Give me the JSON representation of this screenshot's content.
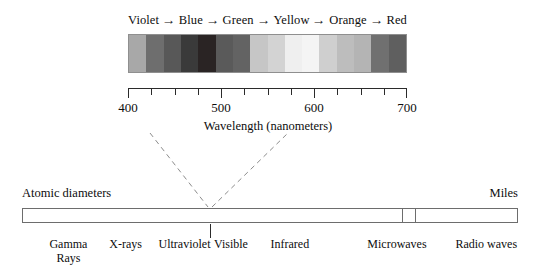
{
  "visible_spectrum": {
    "color_names": [
      "Violet",
      "Blue",
      "Green",
      "Yellow",
      "Orange",
      "Red"
    ],
    "arrow_glyph": "→",
    "bands": [
      {
        "name": "violet-far",
        "color": "#a8a8a8"
      },
      {
        "name": "violet",
        "color": "#6e6e6e"
      },
      {
        "name": "violet-blue",
        "color": "#585858"
      },
      {
        "name": "blue",
        "color": "#3a3a3a"
      },
      {
        "name": "blue-deep",
        "color": "#2a2424"
      },
      {
        "name": "blue-green",
        "color": "#5a5a5a"
      },
      {
        "name": "green",
        "color": "#636363"
      },
      {
        "name": "green-light",
        "color": "#c6c6c6"
      },
      {
        "name": "yellow-green",
        "color": "#d3d3d3"
      },
      {
        "name": "yellow",
        "color": "#efefef"
      },
      {
        "name": "yellow-pale",
        "color": "#f4f4f4"
      },
      {
        "name": "orange-light",
        "color": "#cfcfcf"
      },
      {
        "name": "orange",
        "color": "#bdbdbd"
      },
      {
        "name": "orange-red",
        "color": "#b4b4b4"
      },
      {
        "name": "red",
        "color": "#707070"
      },
      {
        "name": "red-deep",
        "color": "#5f5f5f"
      }
    ]
  },
  "axis": {
    "title": "Wavelength (nanometers)",
    "min": 400,
    "max": 700,
    "tick_step": 25,
    "major_labels": [
      "400",
      "500",
      "600",
      "700"
    ],
    "major_values": [
      400,
      500,
      600,
      700
    ]
  },
  "em_spectrum": {
    "left_caption": "Atomic diameters",
    "right_caption": "Miles",
    "bands": [
      {
        "label": "Gamma",
        "label2": "Rays",
        "center_pct": 13.0
      },
      {
        "label": "X-rays",
        "center_pct": 29.0
      },
      {
        "label": "Ultraviolet",
        "center_pct": 45.5
      },
      {
        "label": "Visible",
        "center_pct": 58.5
      },
      {
        "label": "Infrared",
        "center_pct": 75.0
      },
      {
        "label": "Microwaves",
        "center_pct": 105.0
      },
      {
        "label": "Radio waves",
        "center_pct": 130.0
      }
    ],
    "visible_slot_start_pct": 76.8,
    "visible_slot_end_pct": 79.4
  }
}
